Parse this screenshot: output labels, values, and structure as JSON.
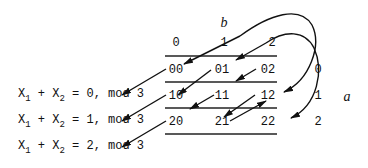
{
  "diagram": {
    "axis_labels": {
      "columns": "b",
      "rows": "a"
    },
    "column_headers": [
      "0",
      "1",
      "2"
    ],
    "row_headers": [
      "0",
      "1",
      "2"
    ],
    "cells": [
      [
        "00",
        "01",
        "02"
      ],
      [
        "10",
        "11",
        "12"
      ],
      [
        "20",
        "21",
        "22"
      ]
    ],
    "equations": [
      {
        "x1": "X",
        "sub1": "1",
        "plus": "+",
        "x2": "X",
        "sub2": "2",
        "rest": "= 0, mod 3"
      },
      {
        "x1": "X",
        "sub1": "1",
        "plus": "+",
        "x2": "X",
        "sub2": "2",
        "rest": "= 1, mod 3"
      },
      {
        "x1": "X",
        "sub1": "1",
        "plus": "+",
        "x2": "X",
        "sub2": "2",
        "rest": "= 2, mod 3"
      }
    ],
    "diagonal_chains": [
      {
        "sum_mod_3": "0",
        "path": [
          "21",
          "12",
          "00"
        ]
      },
      {
        "sum_mod_3": "1",
        "path": [
          "22",
          "01",
          "10"
        ]
      },
      {
        "sum_mod_3": "2",
        "path": [
          "02",
          "11",
          "20"
        ]
      }
    ],
    "colors": {
      "ink": "#111111",
      "background": "#ffffff"
    }
  }
}
